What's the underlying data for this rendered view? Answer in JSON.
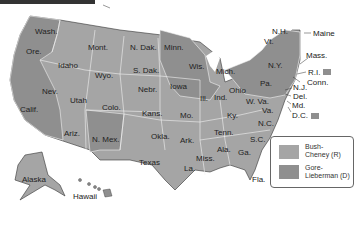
{
  "colors": {
    "bush": "#a5a5a5",
    "gore": "#8f8f8f",
    "border": "#f2f2f2",
    "outline": "#333333"
  },
  "legend": {
    "items": [
      {
        "label_line1": "Bush-",
        "label_line2": "Cheney (R)",
        "color": "#a5a5a5"
      },
      {
        "label_line1": "Gore-",
        "label_line2": "Lieberman (D)",
        "color": "#8f8f8f"
      }
    ]
  },
  "states": {
    "wash": "Wash.",
    "ore": "Ore.",
    "calif": "Calif.",
    "idaho": "Idaho",
    "nev": "Nev.",
    "utah": "Utah",
    "ariz": "Ariz.",
    "mont": "Mont.",
    "wyo": "Wyo.",
    "colo": "Colo.",
    "nmex": "N. Mex.",
    "ndak": "N. Dak.",
    "sdak": "S. Dak.",
    "nebr": "Nebr.",
    "kans": "Kans.",
    "okla": "Okla.",
    "texas": "Texas",
    "minn": "Minn.",
    "iowa": "Iowa",
    "mo": "Mo.",
    "ark": "Ark.",
    "la": "La.",
    "wis": "Wis.",
    "ill": "Ill.",
    "mich": "Mich.",
    "ind": "Ind.",
    "ohio": "Ohio",
    "ky": "Ky.",
    "tenn": "Tenn.",
    "miss": "Miss.",
    "ala": "Ala.",
    "ga": "Ga.",
    "fla": "Fla.",
    "sc": "S.C.",
    "nc": "N.C.",
    "va": "Va.",
    "wva": "W. Va.",
    "pa": "Pa.",
    "ny": "N.Y.",
    "vt": "Vt.",
    "nh": "N.H.",
    "maine": "Maine",
    "mass": "Mass.",
    "ri": "R.I.",
    "conn": "Conn.",
    "nj": "N.J.",
    "del": "Del.",
    "md": "Md.",
    "dc": "D.C.",
    "alaska": "Alaska",
    "hawaii": "Hawaii"
  }
}
